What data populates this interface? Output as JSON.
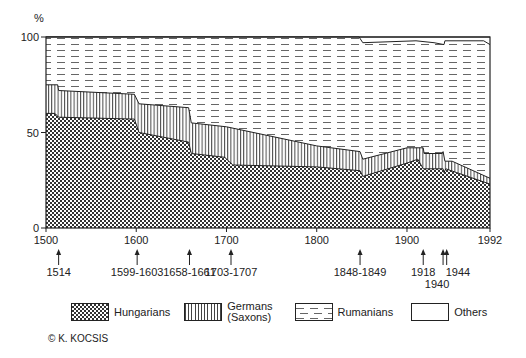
{
  "chart_data": {
    "type": "area",
    "title": "",
    "ylabel": "%",
    "xlabel": "",
    "ylim": [
      0,
      100
    ],
    "xlim": [
      1500,
      1992
    ],
    "x_ticks": [
      1500,
      1600,
      1700,
      1800,
      1900,
      1992
    ],
    "y_ticks": [
      0,
      50,
      100
    ],
    "stacked": true,
    "series": [
      {
        "name": "Hungarians",
        "pattern": "crosshatch",
        "top": [
          [
            1500,
            60
          ],
          [
            1510,
            60
          ],
          [
            1514,
            58
          ],
          [
            1598,
            57
          ],
          [
            1603,
            50
          ],
          [
            1658,
            45
          ],
          [
            1661,
            39
          ],
          [
            1698,
            37
          ],
          [
            1707,
            33
          ],
          [
            1800,
            32
          ],
          [
            1848,
            30
          ],
          [
            1851,
            27
          ],
          [
            1900,
            34
          ],
          [
            1912,
            36
          ],
          [
            1918,
            31
          ],
          [
            1940,
            31
          ],
          [
            1941,
            29
          ],
          [
            1943,
            31
          ],
          [
            1955,
            29
          ],
          [
            1992,
            23
          ]
        ]
      },
      {
        "name": "Germans (Saxons)",
        "pattern": "vertical-lines",
        "top": [
          [
            1500,
            75
          ],
          [
            1513,
            75
          ],
          [
            1514,
            72
          ],
          [
            1598,
            70
          ],
          [
            1603,
            65
          ],
          [
            1658,
            63
          ],
          [
            1661,
            55
          ],
          [
            1700,
            53
          ],
          [
            1800,
            43
          ],
          [
            1848,
            40
          ],
          [
            1851,
            36
          ],
          [
            1900,
            42
          ],
          [
            1918,
            42
          ],
          [
            1919,
            39
          ],
          [
            1939,
            39
          ],
          [
            1940,
            40
          ],
          [
            1942,
            35
          ],
          [
            1950,
            35
          ],
          [
            1992,
            26
          ]
        ]
      },
      {
        "name": "Rumanians",
        "pattern": "dashes",
        "top": [
          [
            1500,
            100
          ],
          [
            1847,
            100
          ],
          [
            1851,
            97
          ],
          [
            1910,
            98
          ],
          [
            1930,
            97
          ],
          [
            1941,
            96
          ],
          [
            1942,
            98
          ],
          [
            1985,
            98
          ],
          [
            1992,
            96
          ]
        ]
      },
      {
        "name": "Others",
        "pattern": "none",
        "top": [
          [
            1500,
            100
          ],
          [
            1992,
            100
          ]
        ]
      }
    ],
    "events": [
      {
        "label": "1514",
        "year": 1514,
        "row": 0
      },
      {
        "label": "1599-1603",
        "year": 1601,
        "row": 0
      },
      {
        "label": "1658-1661",
        "year": 1659,
        "row": 0
      },
      {
        "label": "1703-1707",
        "year": 1705,
        "row": 0
      },
      {
        "label": "1848-1849",
        "year": 1848,
        "row": 0
      },
      {
        "label": "1918",
        "year": 1918,
        "row": 0
      },
      {
        "label": "1940",
        "year": 1940,
        "row": 1
      },
      {
        "label": "1944",
        "year": 1944,
        "row": 0
      }
    ],
    "legend_position": "bottom"
  },
  "axis": {
    "y_unit": "%"
  },
  "legend": [
    {
      "label": "Hungarians",
      "pattern": "crosshatch"
    },
    {
      "label": "Germans\n(Saxons)",
      "pattern": "vertical-lines"
    },
    {
      "label": "Rumanians",
      "pattern": "dashes"
    },
    {
      "label": "Others",
      "pattern": "none"
    }
  ],
  "credit": "© K. KOCSIS",
  "colors": {
    "ink": "#222222",
    "paper": "#ffffff"
  }
}
